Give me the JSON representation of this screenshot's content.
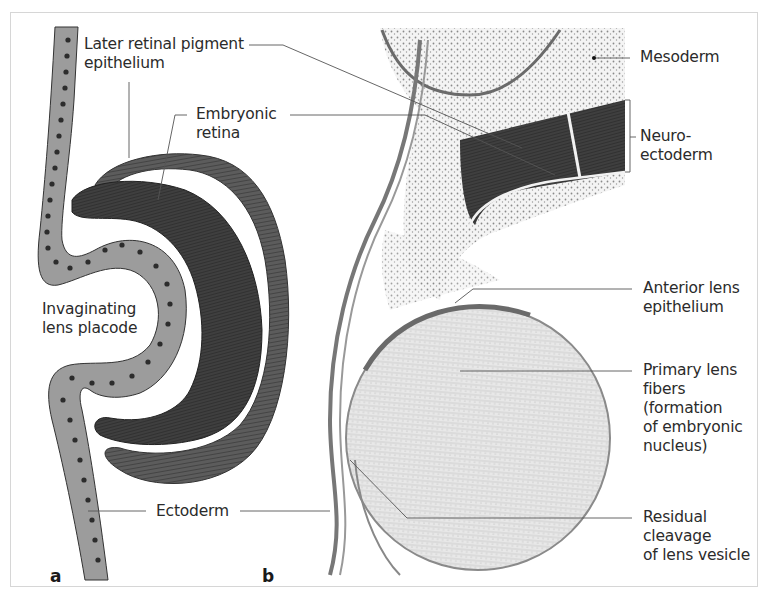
{
  "figure": {
    "panels": [
      {
        "id": "a",
        "letter": "a",
        "description": "Schematic of invaginating lens placode and optic cup"
      },
      {
        "id": "b",
        "letter": "b",
        "description": "Histological section of developing lens and optic cup"
      }
    ],
    "labels": {
      "later_rpe": "Later retinal pigment\nepithelium",
      "embryonic_retina": "Embryonic\nretina",
      "invaginating_lens_placode": "Invaginating\nlens placode",
      "ectoderm": "Ectoderm",
      "mesoderm": "Mesoderm",
      "neuroectoderm": "Neuro-\nectoderm",
      "anterior_lens_epithelium": "Anterior lens\nepithelium",
      "primary_lens_fibers": "Primary lens\nfibers\n(formation\nof embryonic\nnucleus)",
      "residual_cleavage": "Residual\ncleavage\nof lens vesicle"
    },
    "colors": {
      "ectoderm_fill": "#9a9a9a",
      "neuroectoderm_fill": "#4a4a4a",
      "retina_fill": "#5a5a5a",
      "leader_line": "#555555",
      "frame_border": "#d6d6d6"
    }
  }
}
